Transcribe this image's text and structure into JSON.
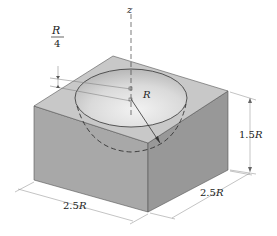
{
  "figure": {
    "labels": {
      "z_axis": "z",
      "depth_fraction_num": "R",
      "depth_fraction_den": "4",
      "radius": "R",
      "height_value": "1.5",
      "height_unit": "R",
      "width_value": "2.5",
      "width_unit": "R",
      "depth_value": "2.5",
      "depth_unit": "R"
    },
    "colors": {
      "top_face": "#c9c9c9",
      "left_face": "#a9a9a9",
      "right_face": "#9a9a9a",
      "cavity": "#dcdcdc",
      "lines": "#444444",
      "dim_lines": "#888888"
    }
  }
}
